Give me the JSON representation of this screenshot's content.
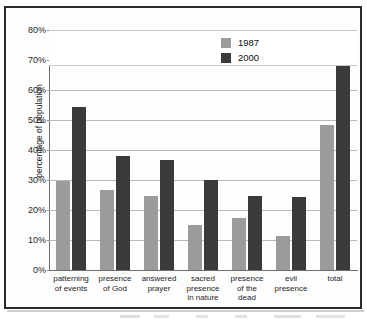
{
  "chart_data": {
    "type": "bar",
    "title": "",
    "xlabel": "",
    "ylabel": "percentage of population",
    "ylim": [
      0,
      80
    ],
    "ytick_labels": [
      "80%",
      "70%",
      "60%",
      "50%",
      "40%",
      "30%",
      "20%",
      "10%",
      "0%"
    ],
    "ytick_values": [
      80,
      70,
      60,
      50,
      40,
      30,
      20,
      10,
      0
    ],
    "grid": true,
    "legend_position": "top-center",
    "categories": [
      "patterning\nof events",
      "presence\nof God",
      "answered\nprayer",
      "sacred\npresence\nin nature",
      "presence\nof the\ndead",
      "evil\npresence",
      "total"
    ],
    "series": [
      {
        "name": "1987",
        "color": "#9b9b9b",
        "values": [
          29.8,
          26.8,
          24.8,
          15.0,
          17.5,
          11.5,
          48.2
        ]
      },
      {
        "name": "2000",
        "color": "#3a3a3a",
        "values": [
          54.3,
          38.1,
          36.7,
          29.9,
          24.8,
          24.2,
          77.1
        ]
      }
    ]
  },
  "legend": {
    "entries": [
      {
        "label": "1987",
        "color": "#9b9b9b"
      },
      {
        "label": "2000",
        "color": "#3a3a3a"
      }
    ]
  }
}
